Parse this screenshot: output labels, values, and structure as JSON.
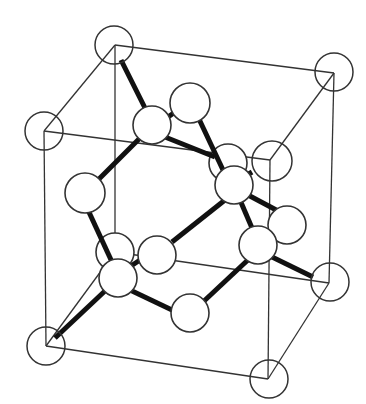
{
  "diagram": {
    "type": "crystal-lattice",
    "colors": {
      "edge": "#333333",
      "bond": "#111111",
      "atom_fill": "#ffffff"
    },
    "cube_vertices": {
      "top_back_left": [
        115,
        45
      ],
      "top_back_right": [
        334,
        73
      ],
      "top_front_left": [
        44,
        131
      ],
      "top_front_right": [
        270,
        160
      ],
      "bottom_back_left": [
        115,
        252
      ],
      "bottom_back_right": [
        329,
        283
      ],
      "bottom_front_left": [
        46,
        346
      ],
      "bottom_front_right": [
        268,
        379
      ]
    },
    "corner_atom_count": 8,
    "interior_atom_count": 10,
    "bond_count": 16
  }
}
